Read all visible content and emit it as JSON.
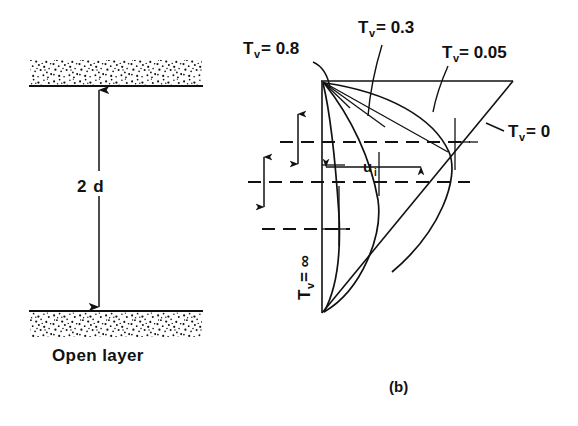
{
  "figure": {
    "caption": "(b)",
    "background_color": "#ffffff",
    "ink_color": "#111111",
    "width": 578,
    "height": 426
  },
  "left_panel": {
    "name": "open-layer-schematic",
    "dimension_label": "2 d",
    "caption": "Open layer",
    "top_boundary_label": "",
    "bottom_boundary_label": "",
    "hatch_style": "stippled"
  },
  "right_panel": {
    "name": "isochrone-diagram",
    "caption": "(b)",
    "velocity_label": "u",
    "velocity_label_sub": "i",
    "axis_symbol": "T",
    "axis_symbol_sub": "v",
    "isochrones": [
      {
        "id": "tv-0-8",
        "symbol": "T",
        "sub": "v",
        "eq": "=",
        "value": "0.8"
      },
      {
        "id": "tv-0-3",
        "symbol": "T",
        "sub": "v",
        "eq": "=",
        "value": "0.3"
      },
      {
        "id": "tv-0-05",
        "symbol": "T",
        "sub": "v",
        "eq": "=",
        "value": "0.05"
      },
      {
        "id": "tv-0",
        "symbol": "T",
        "sub": "v",
        "eq": "=",
        "value": "0"
      },
      {
        "id": "tv-inf",
        "symbol": "T",
        "sub": "v",
        "eq": "=",
        "value": "∞"
      }
    ],
    "labels": {
      "tv_08": "T",
      "tv_08_sub": "v",
      "tv_08_val": "= 0.8",
      "tv_03_val": "= 0.3",
      "tv_005_val": "= 0.05",
      "tv_0_val": "= 0",
      "tv_inf_val": "= ∞"
    }
  }
}
